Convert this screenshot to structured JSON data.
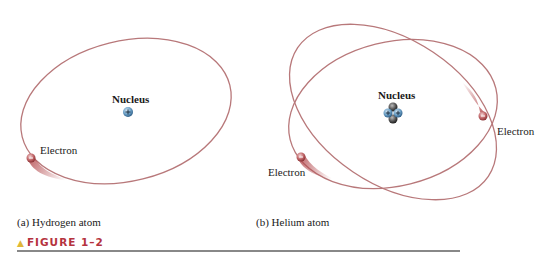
{
  "panels": [
    {
      "caption": "(a) Hydrogen atom",
      "nucleus_label": "Nucleus",
      "nucleus_charge_symbol": "+",
      "electrons": [
        {
          "label": "Electron",
          "charge_symbol": "−"
        }
      ]
    },
    {
      "caption": "(b) Helium atom",
      "nucleus_label": "Nucleus",
      "nucleus_charge_symbol": "+",
      "electrons": [
        {
          "label": "Electron",
          "charge_symbol": "−"
        },
        {
          "label": "Electron",
          "charge_symbol": "−"
        }
      ]
    }
  ],
  "figure": {
    "marker": "▲",
    "label": "FIGURE 1–2"
  },
  "colors": {
    "orbit": "#b8787a",
    "electron": "#b44b4f",
    "proton": "#5b8fb8",
    "neutron": "#3a3a3a",
    "figure_label": "#b5333e",
    "marker": "#e0b838"
  }
}
